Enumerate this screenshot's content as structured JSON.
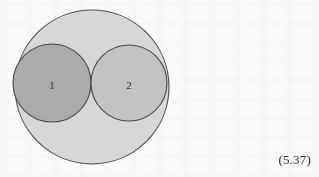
{
  "page": {
    "background_color": "#fbfaf8",
    "width": 319,
    "height": 177
  },
  "figure": {
    "name": "three-tangent-circles-diagram",
    "stroke_color": "#4a4846",
    "outer_circle": {
      "label": "",
      "fill_color": "#d8d7d4",
      "cx": 92,
      "cy": 87,
      "r": 77
    },
    "inner_circles": [
      {
        "label": "1",
        "fill_color": "#ababa8",
        "cx": 52,
        "cy": 83,
        "r": 39,
        "label_x": 52,
        "label_y": 89
      },
      {
        "label": "2",
        "fill_color": "#c4c3c0",
        "cx": 129,
        "cy": 83,
        "r": 38,
        "label_x": 129,
        "label_y": 89
      }
    ]
  },
  "equation_number": {
    "text": "(5.37)"
  },
  "chart_data": {
    "type": "diagram",
    "title": "",
    "shapes": [
      {
        "shape": "circle",
        "name": "outer",
        "label": "",
        "cx": 92,
        "cy": 87,
        "r": 77,
        "fill": "#d8d7d4"
      },
      {
        "shape": "circle",
        "name": "inner-1",
        "label": "1",
        "cx": 52,
        "cy": 83,
        "r": 39,
        "fill": "#ababa8"
      },
      {
        "shape": "circle",
        "name": "inner-2",
        "label": "2",
        "cx": 129,
        "cy": 83,
        "r": 38,
        "fill": "#c4c3c0"
      }
    ],
    "annotations": [
      "(5.37)"
    ]
  }
}
